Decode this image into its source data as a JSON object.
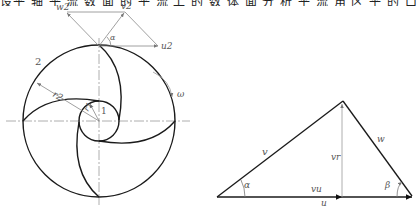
{
  "top_text_fragment": "设平 轴 平 流 数 面 的 平 流 上 的 数 体 面 分 析 平 流 角 区 平 的 口 平 体",
  "impeller": {
    "outer_label": "2",
    "inner_label": "1",
    "r2_label": "r2",
    "r1_label": "r1",
    "omega_label": "ω"
  },
  "outlet_triangle": {
    "w2_label": "w2",
    "v2_label": "v2",
    "u2_label": "u2",
    "alpha_label": "α"
  },
  "velocity_triangle": {
    "v_label": "v",
    "w_label": "w",
    "vr_label": "vr",
    "vu_label": "vu",
    "u_label": "u",
    "alpha_label": "α",
    "beta_label": "β"
  },
  "colors": {
    "thick_line": "#1a1a1a",
    "thin_line": "#888888",
    "label": "#555555"
  }
}
